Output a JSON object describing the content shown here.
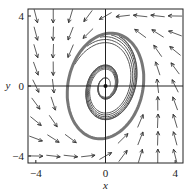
{
  "chart_data": {
    "type": "phase-portrait",
    "title": "",
    "xlabel": "x",
    "ylabel": "y",
    "xlim": [
      -4.45,
      4.45
    ],
    "ylim": [
      -4.4,
      4.4
    ],
    "xticks": [
      -4,
      0,
      4
    ],
    "yticks": [
      -4,
      0,
      4
    ],
    "xtick_labels": [
      "−4",
      "0",
      "4"
    ],
    "ytick_labels": [
      "−4",
      "0",
      "4"
    ],
    "axes_lines_through_origin": true,
    "field": {
      "description": "direction field of a planar system with counterclockwise rotation and an attracting limit cycle",
      "grid": [
        -4,
        -3,
        -2,
        -1,
        0,
        1,
        2,
        3,
        4
      ]
    },
    "equilibrium": {
      "x": 0,
      "y": 0,
      "type": "unstable spiral"
    },
    "limit_cycle": {
      "center": [
        0,
        0
      ],
      "semi_axis_x": 2.15,
      "semi_axis_y": 3.05,
      "tilt_deg": -12
    },
    "spiral_trajectories": 6,
    "colors": {
      "field": "#333333",
      "trajectory": "#555555",
      "limit_cycle": "#777777",
      "axes": "#222222"
    }
  }
}
